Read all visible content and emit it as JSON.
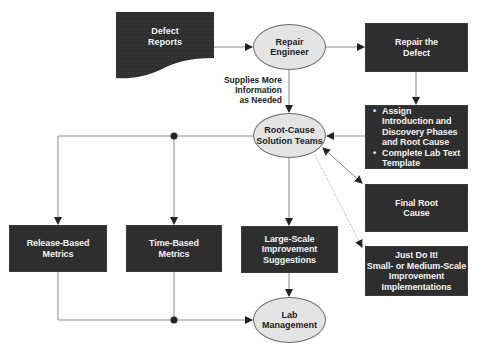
{
  "diagram": {
    "colors": {
      "box_fill": "#2e2e2e",
      "box_text": "#f2f2f2",
      "ellipse_fill": "#e4e4e4",
      "ellipse_stroke": "#6a6a6a",
      "connector": "#8a8a8a",
      "arrowhead": "#222222"
    },
    "nodes": {
      "defect_reports": {
        "shape": "document",
        "lines": [
          "Defect",
          "Reports"
        ]
      },
      "repair_engineer": {
        "shape": "ellipse",
        "lines": [
          "Repair",
          "Engineer"
        ]
      },
      "repair_defect": {
        "shape": "box",
        "lines": [
          "Repair the",
          "Defect"
        ]
      },
      "assign_tasks": {
        "shape": "box",
        "bullets": [
          "Assign Introduction and Discovery Phases and Root Cause",
          "Complete Lab Text Template"
        ]
      },
      "root_cause_teams": {
        "shape": "ellipse",
        "lines": [
          "Root-Cause",
          "Solution Teams"
        ]
      },
      "final_root_cause": {
        "shape": "box",
        "lines": [
          "Final Root",
          "Cause"
        ]
      },
      "just_do_it": {
        "shape": "box",
        "lines": [
          "Just Do It!",
          "Small- or Medium-Scale",
          "Improvement",
          "Implementations"
        ]
      },
      "release_metrics": {
        "shape": "box",
        "lines": [
          "Release-Based",
          "Metrics"
        ]
      },
      "time_metrics": {
        "shape": "box",
        "lines": [
          "Time-Based",
          "Metrics"
        ]
      },
      "large_scale": {
        "shape": "box",
        "lines": [
          "Large-Scale",
          "Improvement",
          "Suggestions"
        ]
      },
      "lab_management": {
        "shape": "ellipse",
        "lines": [
          "Lab",
          "Management"
        ]
      }
    },
    "edge_labels": {
      "supplies_info": [
        "Supplies More",
        "Information",
        "as Needed"
      ]
    },
    "edges": [
      {
        "from": "defect_reports",
        "to": "repair_engineer"
      },
      {
        "from": "repair_engineer",
        "to": "repair_defect"
      },
      {
        "from": "repair_engineer",
        "to": "root_cause_teams",
        "label": "supplies_info"
      },
      {
        "from": "repair_defect",
        "to": "assign_tasks"
      },
      {
        "from": "assign_tasks",
        "to": "root_cause_teams"
      },
      {
        "from": "root_cause_teams",
        "to": "final_root_cause",
        "bidirectional": true
      },
      {
        "from": "root_cause_teams",
        "to": "just_do_it",
        "style": "dotted"
      },
      {
        "from": "root_cause_teams",
        "to": "release_metrics"
      },
      {
        "from": "root_cause_teams",
        "to": "time_metrics"
      },
      {
        "from": "root_cause_teams",
        "to": "large_scale"
      },
      {
        "from": "release_metrics",
        "to": "lab_management"
      },
      {
        "from": "time_metrics",
        "to": "lab_management"
      },
      {
        "from": "large_scale",
        "to": "lab_management"
      }
    ]
  }
}
